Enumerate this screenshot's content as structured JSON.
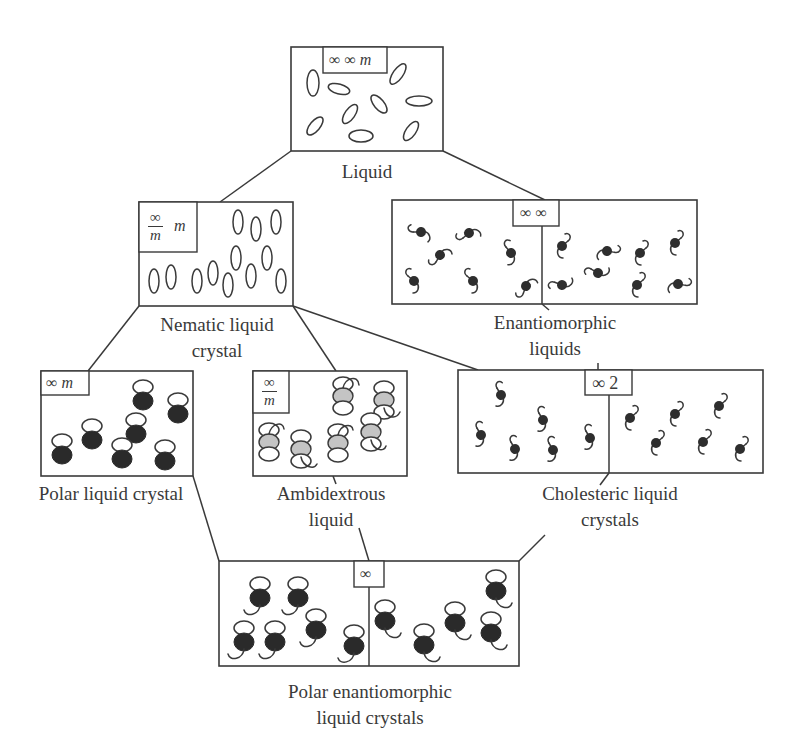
{
  "diagram": {
    "type": "symmetry-hierarchy",
    "nodes": {
      "liquid": {
        "label": "Liquid",
        "symmetry": "∞ ∞ m",
        "symmetry_parts": [
          "∞ ∞",
          "m"
        ]
      },
      "nematic": {
        "label_line1": "Nematic liquid",
        "label_line2": "crystal",
        "symmetry_num": "∞",
        "symmetry_den": "m",
        "symmetry_suffix": "m"
      },
      "enantiomorphic": {
        "label_line1": "Enantiomorphic",
        "label_line2": "liquids",
        "symmetry": "∞ ∞"
      },
      "polar_lc": {
        "label": "Polar liquid crystal",
        "symmetry": "∞",
        "symmetry_suffix": "m"
      },
      "ambidextrous": {
        "label_line1": "Ambidextrous",
        "label_line2": "liquid",
        "symmetry_num": "∞",
        "symmetry_den": "m"
      },
      "cholesteric": {
        "label_line1": "Cholesteric liquid",
        "label_line2": "crystals",
        "symmetry": "∞ 2"
      },
      "polar_enantiomorphic": {
        "label_line1": "Polar enantiomorphic",
        "label_line2": "liquid crystals",
        "symmetry": "∞"
      }
    },
    "edges": [
      [
        "liquid",
        "nematic"
      ],
      [
        "liquid",
        "enantiomorphic"
      ],
      [
        "nematic",
        "polar_lc"
      ],
      [
        "nematic",
        "ambidextrous"
      ],
      [
        "nematic",
        "cholesteric"
      ],
      [
        "enantiomorphic",
        "cholesteric"
      ],
      [
        "polar_lc",
        "polar_enantiomorphic"
      ],
      [
        "ambidextrous",
        "polar_enantiomorphic"
      ],
      [
        "cholesteric",
        "polar_enantiomorphic"
      ]
    ]
  }
}
